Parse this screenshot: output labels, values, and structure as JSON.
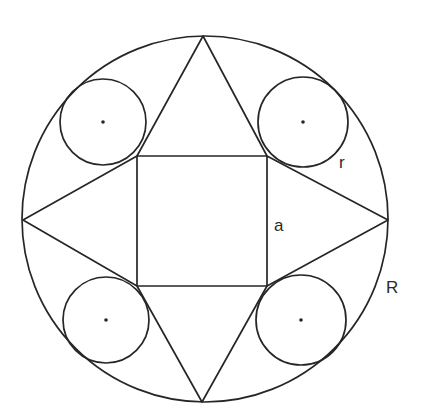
{
  "figure": {
    "type": "geometry",
    "colors": {
      "stroke": "#262626",
      "background": "#ffffff",
      "text": "#2a2a2a"
    }
  },
  "labels": {
    "small_radius": "r",
    "square_side": "a",
    "large_radius": "R"
  },
  "geometry": {
    "big_circle": {
      "cx": 205,
      "cy": 219,
      "r": 183
    },
    "square": {
      "x": 137,
      "y": 156,
      "w": 130,
      "h": 130
    },
    "star_points": {
      "top": [
        203,
        36
      ],
      "right": [
        388,
        220
      ],
      "bottom": [
        202,
        402
      ],
      "left": [
        23,
        220
      ]
    },
    "small_circles": [
      {
        "id": "top-left",
        "cx": 103,
        "cy": 122,
        "r": 43
      },
      {
        "id": "top-right",
        "cx": 303,
        "cy": 122,
        "r": 45
      },
      {
        "id": "bottom-left",
        "cx": 106,
        "cy": 320,
        "r": 43
      },
      {
        "id": "bottom-right",
        "cx": 301,
        "cy": 320,
        "r": 45
      }
    ]
  }
}
